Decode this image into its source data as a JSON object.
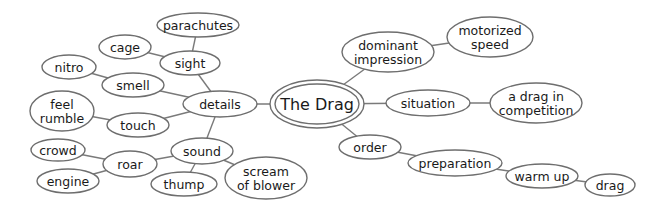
{
  "diagram": {
    "type": "mind-map",
    "colors": {
      "background": "#ffffff",
      "stroke": "#6e6e6e",
      "text": "#1a1a1a"
    },
    "center": {
      "id": "the-drag",
      "label": "The Drag",
      "cx": 317,
      "cy": 104,
      "rx": 47,
      "ry": 24
    },
    "nodes": [
      {
        "id": "details",
        "lines": [
          "details"
        ],
        "cx": 220,
        "cy": 104,
        "rx": 37,
        "ry": 13,
        "parent": "the-drag"
      },
      {
        "id": "sight",
        "lines": [
          "sight"
        ],
        "cx": 190,
        "cy": 63,
        "rx": 30,
        "ry": 12,
        "parent": "details"
      },
      {
        "id": "parachutes",
        "lines": [
          "parachutes"
        ],
        "cx": 198,
        "cy": 25,
        "rx": 41,
        "ry": 12,
        "parent": "sight"
      },
      {
        "id": "cage",
        "lines": [
          "cage"
        ],
        "cx": 125,
        "cy": 47,
        "rx": 26,
        "ry": 12,
        "parent": "sight"
      },
      {
        "id": "smell",
        "lines": [
          "smell"
        ],
        "cx": 133,
        "cy": 85,
        "rx": 31,
        "ry": 12,
        "parent": "details"
      },
      {
        "id": "nitro",
        "lines": [
          "nitro"
        ],
        "cx": 69,
        "cy": 67,
        "rx": 27,
        "ry": 12,
        "parent": "smell"
      },
      {
        "id": "touch",
        "lines": [
          "touch"
        ],
        "cx": 138,
        "cy": 125,
        "rx": 31,
        "ry": 12,
        "parent": "details"
      },
      {
        "id": "feel-rumble",
        "lines": [
          "feel",
          "rumble"
        ],
        "cx": 62,
        "cy": 111,
        "rx": 32,
        "ry": 20,
        "parent": "touch"
      },
      {
        "id": "sound",
        "lines": [
          "sound"
        ],
        "cx": 202,
        "cy": 151,
        "rx": 31,
        "ry": 13,
        "parent": "details"
      },
      {
        "id": "roar",
        "lines": [
          "roar"
        ],
        "cx": 130,
        "cy": 164,
        "rx": 27,
        "ry": 13,
        "parent": "sound"
      },
      {
        "id": "crowd",
        "lines": [
          "crowd"
        ],
        "cx": 58,
        "cy": 150,
        "rx": 27,
        "ry": 11,
        "parent": "roar"
      },
      {
        "id": "engine",
        "lines": [
          "engine"
        ],
        "cx": 68,
        "cy": 181,
        "rx": 31,
        "ry": 12,
        "parent": "roar"
      },
      {
        "id": "thump",
        "lines": [
          "thump"
        ],
        "cx": 184,
        "cy": 184,
        "rx": 33,
        "ry": 12,
        "parent": "sound"
      },
      {
        "id": "scream-of-blower",
        "lines": [
          "scream",
          "of blower"
        ],
        "cx": 266,
        "cy": 178,
        "rx": 41,
        "ry": 21,
        "parent": "sound"
      },
      {
        "id": "dominant-impression",
        "lines": [
          "dominant",
          "impression"
        ],
        "cx": 388,
        "cy": 52,
        "rx": 46,
        "ry": 20,
        "parent": "the-drag"
      },
      {
        "id": "motorized-speed",
        "lines": [
          "motorized",
          "speed"
        ],
        "cx": 490,
        "cy": 37,
        "rx": 43,
        "ry": 20,
        "parent": "dominant-impression"
      },
      {
        "id": "situation",
        "lines": [
          "situation"
        ],
        "cx": 428,
        "cy": 103,
        "rx": 42,
        "ry": 13,
        "parent": "the-drag"
      },
      {
        "id": "a-drag-in-competition",
        "lines": [
          "a drag in",
          "competition"
        ],
        "cx": 536,
        "cy": 103,
        "rx": 46,
        "ry": 20,
        "parent": "situation"
      },
      {
        "id": "order",
        "lines": [
          "order"
        ],
        "cx": 370,
        "cy": 147,
        "rx": 31,
        "ry": 12,
        "parent": "the-drag"
      },
      {
        "id": "preparation",
        "lines": [
          "preparation"
        ],
        "cx": 455,
        "cy": 163,
        "rx": 47,
        "ry": 13,
        "parent": "order"
      },
      {
        "id": "warm-up",
        "lines": [
          "warm up"
        ],
        "cx": 542,
        "cy": 176,
        "rx": 36,
        "ry": 12,
        "parent": "preparation"
      },
      {
        "id": "drag",
        "lines": [
          "drag"
        ],
        "cx": 610,
        "cy": 185,
        "rx": 25,
        "ry": 11,
        "parent": "warm-up"
      }
    ]
  }
}
